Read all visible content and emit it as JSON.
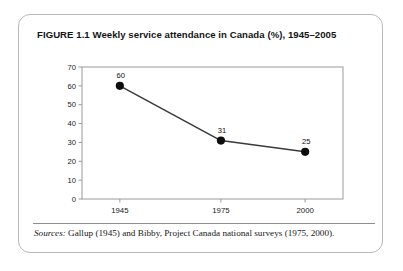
{
  "figure": {
    "title": "FIGURE 1.1  Weekly service attendance in Canada (%), 1945–2005",
    "source_label": "Sources:",
    "source_text": " Gallup (1945) and Bibby, Project Canada national surveys (1975, 2000)."
  },
  "chart_data": {
    "type": "line",
    "title": "Weekly service attendance in Canada (%), 1945–2005",
    "xlabel": "",
    "ylabel": "",
    "categories": [
      "1945",
      "1975",
      "2000"
    ],
    "x": [
      1945,
      1975,
      2000
    ],
    "values": [
      60,
      31,
      25
    ],
    "point_labels": [
      "60",
      "31",
      "25"
    ],
    "ylim": [
      0,
      70
    ],
    "yticks": [
      0,
      10,
      20,
      30,
      40,
      50,
      60,
      70
    ],
    "ytick_labels": [
      "0",
      "10",
      "20",
      "30",
      "40",
      "50",
      "60",
      "70"
    ],
    "xtick_labels": [
      "1945",
      "1975",
      "2000"
    ],
    "grid": false,
    "legend": false,
    "line_color": "#3a3a3a",
    "marker_color": "#0d0d0d",
    "axis_color": "#9a9a9a"
  }
}
